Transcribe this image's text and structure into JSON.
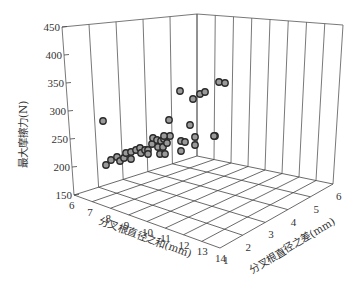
{
  "chart_data": {
    "type": "scatter3d",
    "title": "",
    "xlabel": "分叉根直径之和(mm)",
    "ylabel": "分叉根直径之差(mm)",
    "zlabel": "最大摩擦力(N)",
    "x_ticks": [
      "6",
      "7",
      "8",
      "9",
      "10",
      "11",
      "12",
      "13",
      "14"
    ],
    "y_ticks": [
      "1",
      "2",
      "3",
      "4",
      "5",
      "6"
    ],
    "z_ticks": [
      "150",
      "200",
      "250",
      "300",
      "350",
      "400",
      "450"
    ],
    "xlim": [
      6,
      14
    ],
    "ylim": [
      1,
      6
    ],
    "zlim": [
      150,
      450
    ],
    "grid": true,
    "marker": "open-circle",
    "points_screen": [
      [
        103,
        121
      ],
      [
        106,
        165
      ],
      [
        111,
        160
      ],
      [
        117,
        157
      ],
      [
        120,
        161
      ],
      [
        124,
        158
      ],
      [
        126,
        153
      ],
      [
        131,
        152
      ],
      [
        131,
        159
      ],
      [
        136,
        150
      ],
      [
        140,
        148
      ],
      [
        141,
        153
      ],
      [
        145,
        150
      ],
      [
        148,
        150
      ],
      [
        148,
        154
      ],
      [
        152,
        144
      ],
      [
        153,
        138
      ],
      [
        157,
        140
      ],
      [
        158,
        147
      ],
      [
        161,
        141
      ],
      [
        164,
        139
      ],
      [
        163,
        147
      ],
      [
        167,
        143
      ],
      [
        170,
        136
      ],
      [
        160,
        154
      ],
      [
        165,
        154
      ],
      [
        180,
        91
      ],
      [
        193,
        99
      ],
      [
        200,
        94
      ],
      [
        205,
        92
      ],
      [
        219,
        82
      ],
      [
        225,
        83
      ],
      [
        169,
        120
      ],
      [
        190,
        125
      ],
      [
        164,
        136
      ],
      [
        195,
        137
      ],
      [
        215,
        136
      ],
      [
        181,
        141
      ],
      [
        185,
        142
      ],
      [
        195,
        145
      ],
      [
        181,
        151
      ],
      [
        214,
        136
      ]
    ]
  }
}
